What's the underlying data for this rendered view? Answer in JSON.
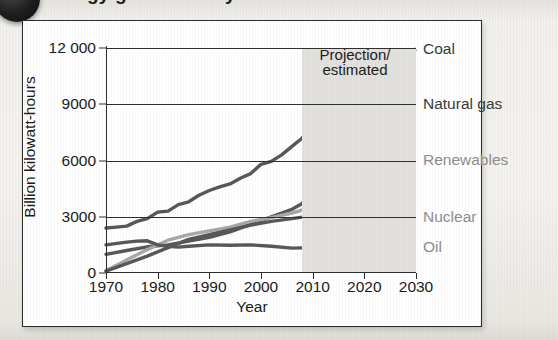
{
  "figure": {
    "badge_icon": "numbered-bullet-icon",
    "title_cropped": "Energy generated by source"
  },
  "chart_data": {
    "type": "line",
    "title": "",
    "xlabel": "Year",
    "ylabel": "Billion kilowatt-hours",
    "xlim": [
      1970,
      2030
    ],
    "ylim": [
      0,
      12000
    ],
    "xticks": [
      "1970",
      "1980",
      "1990",
      "2000",
      "2010",
      "2020",
      "2030"
    ],
    "xtick_values": [
      1970,
      1980,
      1990,
      2000,
      2010,
      2020,
      2030
    ],
    "yticks": [
      "0",
      "3000",
      "6000",
      "9000",
      "12 000"
    ],
    "ytick_values": [
      0,
      3000,
      6000,
      9000,
      12000
    ],
    "grid": true,
    "legend_position": "right-of-plot-inline",
    "projection_start_year": 2008,
    "annotation": {
      "line1": "Projection/",
      "line2": "estimated"
    },
    "shaded_region_label": "projection-region",
    "series": [
      {
        "name": "Coal",
        "color": "#585858",
        "label_color": "#3a3a3a",
        "historical": {
          "x": [
            1970,
            1972,
            1974,
            1976,
            1978,
            1980,
            1982,
            1984,
            1986,
            1988,
            1990,
            1992,
            1994,
            1996,
            1998,
            2000,
            2002,
            2004,
            2006,
            2008
          ],
          "y": [
            2400,
            2450,
            2500,
            2750,
            2900,
            3250,
            3300,
            3650,
            3800,
            4150,
            4400,
            4600,
            4750,
            5050,
            5300,
            5800,
            5950,
            6300,
            6750,
            7200
          ]
        },
        "projection": {
          "x": [
            2008,
            2012,
            2016,
            2020,
            2024,
            2028,
            2030
          ],
          "y": [
            7200,
            8150,
            9000,
            9800,
            10700,
            11600,
            11950
          ]
        },
        "value_1970": 2400,
        "value_2030": 11950
      },
      {
        "name": "Natural gas",
        "color": "#585858",
        "label_color": "#3a3a3a",
        "historical": {
          "x": [
            1970,
            1974,
            1978,
            1982,
            1986,
            1990,
            1994,
            1998,
            2002,
            2006,
            2008
          ],
          "y": [
            1000,
            1200,
            1400,
            1500,
            1700,
            1900,
            2200,
            2600,
            3000,
            3400,
            3700
          ]
        },
        "projection": {
          "x": [
            2008,
            2012,
            2016,
            2020,
            2024,
            2028,
            2030
          ],
          "y": [
            3700,
            4700,
            5850,
            6900,
            7800,
            8700,
            9000
          ]
        },
        "value_1970": 1000,
        "value_2030": 9000
      },
      {
        "name": "Renewables",
        "color": "#a8a8a8",
        "label_color": "#8d8d8d",
        "historical": {
          "x": [
            1970,
            1974,
            1978,
            1982,
            1986,
            1990,
            1994,
            1998,
            2002,
            2006,
            2008
          ],
          "y": [
            120,
            700,
            1250,
            1750,
            2050,
            2250,
            2450,
            2750,
            2950,
            3200,
            3350
          ]
        },
        "projection": {
          "x": [
            2008,
            2012,
            2016,
            2020,
            2024,
            2028,
            2030
          ],
          "y": [
            3350,
            3800,
            4350,
            4900,
            5400,
            5850,
            6050
          ]
        },
        "value_1970": 120,
        "value_2030": 6050
      },
      {
        "name": "Nuclear",
        "color": "#585858",
        "label_color": "#8d8d8d",
        "historical": {
          "x": [
            1970,
            1974,
            1978,
            1982,
            1986,
            1990,
            1994,
            1998,
            2002,
            2006,
            2008
          ],
          "y": [
            100,
            500,
            900,
            1350,
            1800,
            2050,
            2300,
            2550,
            2750,
            2900,
            2980
          ]
        },
        "projection": {
          "x": [
            2008,
            2014,
            2020,
            2026,
            2030
          ],
          "y": [
            2980,
            3000,
            3000,
            3000,
            3000
          ]
        },
        "value_1970": 100,
        "value_2030": 3000
      },
      {
        "name": "Oil",
        "color": "#585858",
        "label_color": "#8d8d8d",
        "historical": {
          "x": [
            1970,
            1974,
            1976,
            1978,
            1980,
            1982,
            1984,
            1986,
            1990,
            1994,
            1998,
            2002,
            2006,
            2008
          ],
          "y": [
            1500,
            1650,
            1700,
            1720,
            1500,
            1420,
            1380,
            1430,
            1500,
            1480,
            1500,
            1430,
            1330,
            1340
          ]
        },
        "projection": {
          "x": [
            2008,
            2014,
            2020,
            2026,
            2030
          ],
          "y": [
            1340,
            1360,
            1380,
            1400,
            1410
          ]
        },
        "value_1970": 1500,
        "value_2030": 1410
      }
    ]
  }
}
